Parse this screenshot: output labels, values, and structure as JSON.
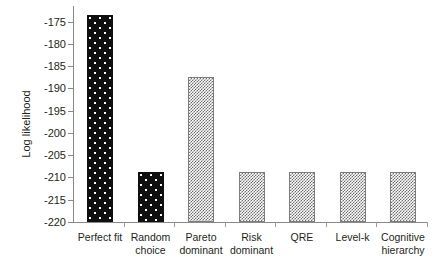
{
  "chart_data": {
    "type": "bar",
    "title": "",
    "xlabel": "",
    "ylabel": "Log likelihood",
    "categories": [
      "Perfect fit",
      "Random choice",
      "Pareto dominant",
      "Risk dominant",
      "QRE",
      "Level-k",
      "Cognitive hierarchy"
    ],
    "category_lines": [
      [
        "Perfect fit"
      ],
      [
        "Random",
        "choice"
      ],
      [
        "Pareto",
        "dominant"
      ],
      [
        "Risk",
        "dominant"
      ],
      [
        "QRE"
      ],
      [
        "Level-k"
      ],
      [
        "Cognitive",
        "hierarchy"
      ]
    ],
    "values": [
      -173.5,
      -208.8,
      -187.4,
      -208.8,
      -208.8,
      -208.8,
      -208.8
    ],
    "ylim": [
      -220,
      -171.5
    ],
    "yticks": [
      -175,
      -180,
      -185,
      -190,
      -195,
      -200,
      -205,
      -210,
      -215,
      -220
    ],
    "ytick_labels": [
      "-175",
      "-180",
      "-185",
      "-190",
      "-195",
      "-200",
      "-205",
      "-210",
      "-215",
      "-220"
    ],
    "grid": false,
    "legend": null,
    "bar_styles": [
      "dark",
      "dark",
      "gray",
      "gray",
      "gray",
      "gray",
      "gray"
    ],
    "colors": {
      "dark_bar": "#100f10",
      "gray_bar": "#6f6f6f",
      "axis": "#8a8a8a",
      "text": "#231f20",
      "background": "#ffffff"
    }
  }
}
